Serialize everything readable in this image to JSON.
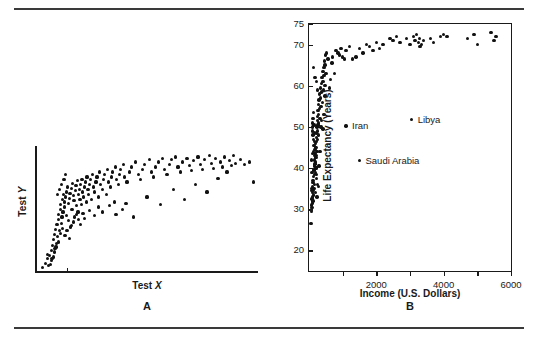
{
  "figure": {
    "rule_top": "horizontal-rule",
    "rule_bottom": "horizontal-rule"
  },
  "panel_a": {
    "letter": "A",
    "xlabel_text": "Test ",
    "xlabel_italic": "X",
    "ylabel_text": "Test ",
    "ylabel_italic": "Y"
  },
  "panel_b": {
    "letter": "B",
    "xlabel": "Income (U.S. Dollars)",
    "ylabel": "Life Expectancy (Years)",
    "ytick_labels": [
      "75",
      "70",
      "60",
      "50",
      "40",
      "30",
      "20"
    ],
    "xtick_labels": [
      "2000",
      "4000",
      "6000"
    ],
    "annotations": [
      {
        "label": "Iran",
        "x": 1100,
        "y": 50.2
      },
      {
        "label": "Libya",
        "x": 3050,
        "y": 51.8
      },
      {
        "label": "Saudi Arabia",
        "x": 1500,
        "y": 41.8
      }
    ]
  },
  "chart_data": [
    {
      "type": "scatter",
      "title": "A",
      "xlabel": "Test X",
      "ylabel": "Test Y",
      "xlim": [
        0,
        100
      ],
      "ylim": [
        0,
        100
      ],
      "grid": false,
      "axis_style": "open-left-bottom",
      "xticks": [
        14
      ],
      "yticks": [],
      "points": [
        [
          3.0,
          3.5
        ],
        [
          4.2,
          7.0
        ],
        [
          5.0,
          10.5
        ],
        [
          5.8,
          5.0
        ],
        [
          6.2,
          13.0
        ],
        [
          6.8,
          9.0
        ],
        [
          7.0,
          17.5
        ],
        [
          7.5,
          21.0
        ],
        [
          7.8,
          12.0
        ],
        [
          8.0,
          26.0
        ],
        [
          8.4,
          30.0
        ],
        [
          8.6,
          18.5
        ],
        [
          8.9,
          34.0
        ],
        [
          9.2,
          23.0
        ],
        [
          9.5,
          38.0
        ],
        [
          9.8,
          28.5
        ],
        [
          10.0,
          42.0
        ],
        [
          10.3,
          46.0
        ],
        [
          10.6,
          33.0
        ],
        [
          10.9,
          50.0
        ],
        [
          11.2,
          54.0
        ],
        [
          11.4,
          39.0
        ],
        [
          11.7,
          44.0
        ],
        [
          12.0,
          58.0
        ],
        [
          12.2,
          48.0
        ],
        [
          12.5,
          62.0
        ],
        [
          12.8,
          52.0
        ],
        [
          13.0,
          56.0
        ],
        [
          13.3,
          60.0
        ],
        [
          13.6,
          64.0
        ],
        [
          13.9,
          45.0
        ],
        [
          14.2,
          68.0
        ],
        [
          14.5,
          41.0
        ],
        [
          14.8,
          55.0
        ],
        [
          15.0,
          59.0
        ],
        [
          15.3,
          63.0
        ],
        [
          15.6,
          36.0
        ],
        [
          15.9,
          67.0
        ],
        [
          16.2,
          50.0
        ],
        [
          16.5,
          71.0
        ],
        [
          16.8,
          61.0
        ],
        [
          17.1,
          57.0
        ],
        [
          17.4,
          44.0
        ],
        [
          17.7,
          65.0
        ],
        [
          18.0,
          69.0
        ],
        [
          18.3,
          53.0
        ],
        [
          18.6,
          73.0
        ],
        [
          18.9,
          48.0
        ],
        [
          19.2,
          62.0
        ],
        [
          19.5,
          66.0
        ],
        [
          19.8,
          58.0
        ],
        [
          20.1,
          70.0
        ],
        [
          20.4,
          54.0
        ],
        [
          20.7,
          74.0
        ],
        [
          21.0,
          64.0
        ],
        [
          21.4,
          60.0
        ],
        [
          21.8,
          68.0
        ],
        [
          22.2,
          72.0
        ],
        [
          22.6,
          56.0
        ],
        [
          23.0,
          76.0
        ],
        [
          23.4,
          66.0
        ],
        [
          23.8,
          62.0
        ],
        [
          24.2,
          70.0
        ],
        [
          24.6,
          74.0
        ],
        [
          25.0,
          58.0
        ],
        [
          25.5,
          78.0
        ],
        [
          26.0,
          68.0
        ],
        [
          26.5,
          64.0
        ],
        [
          27.0,
          72.0
        ],
        [
          27.5,
          76.0
        ],
        [
          28.0,
          60.0
        ],
        [
          28.6,
          80.0
        ],
        [
          29.2,
          70.0
        ],
        [
          29.8,
          66.0
        ],
        [
          30.4,
          74.0
        ],
        [
          31.0,
          78.0
        ],
        [
          31.6,
          62.0
        ],
        [
          32.2,
          82.0
        ],
        [
          32.8,
          72.0
        ],
        [
          33.4,
          68.0
        ],
        [
          34.0,
          76.0
        ],
        [
          34.6,
          80.0
        ],
        [
          35.2,
          56.0
        ],
        [
          35.8,
          84.0
        ],
        [
          36.4,
          74.0
        ],
        [
          37.0,
          70.0
        ],
        [
          37.6,
          78.0
        ],
        [
          38.2,
          82.0
        ],
        [
          38.8,
          50.0
        ],
        [
          39.4,
          86.0
        ],
        [
          40.0,
          76.0
        ],
        [
          41.0,
          72.0
        ],
        [
          42.0,
          80.0
        ],
        [
          43.0,
          84.0
        ],
        [
          44.0,
          44.0
        ],
        [
          45.0,
          88.0
        ],
        [
          46.0,
          78.0
        ],
        [
          47.0,
          74.0
        ],
        [
          48.0,
          82.0
        ],
        [
          49.0,
          86.0
        ],
        [
          50.0,
          60.0
        ],
        [
          51.0,
          90.0
        ],
        [
          52.0,
          80.0
        ],
        [
          53.0,
          76.0
        ],
        [
          54.0,
          84.0
        ],
        [
          55.0,
          88.0
        ],
        [
          56.0,
          54.0
        ],
        [
          57.0,
          91.0
        ],
        [
          58.0,
          82.0
        ],
        [
          59.0,
          78.0
        ],
        [
          60.0,
          86.0
        ],
        [
          61.0,
          90.0
        ],
        [
          62.0,
          66.0
        ],
        [
          63.0,
          92.0
        ],
        [
          64.0,
          84.0
        ],
        [
          65.0,
          80.0
        ],
        [
          66.0,
          88.0
        ],
        [
          67.0,
          58.0
        ],
        [
          68.0,
          91.0
        ],
        [
          69.0,
          85.0
        ],
        [
          70.0,
          81.0
        ],
        [
          71.0,
          89.0
        ],
        [
          72.0,
          70.0
        ],
        [
          73.0,
          92.0
        ],
        [
          74.0,
          86.0
        ],
        [
          75.0,
          82.0
        ],
        [
          76.0,
          90.0
        ],
        [
          77.0,
          64.0
        ],
        [
          78.0,
          93.0
        ],
        [
          79.0,
          87.0
        ],
        [
          80.0,
          83.0
        ],
        [
          81.0,
          91.0
        ],
        [
          82.0,
          75.0
        ],
        [
          83.0,
          88.0
        ],
        [
          84.0,
          84.0
        ],
        [
          85.0,
          92.0
        ],
        [
          86.0,
          80.0
        ],
        [
          87.0,
          89.0
        ],
        [
          88.0,
          85.0
        ],
        [
          89.0,
          93.0
        ],
        [
          90.0,
          87.0
        ],
        [
          92.0,
          90.0
        ],
        [
          94.0,
          86.0
        ],
        [
          96.0,
          88.0
        ],
        [
          98.0,
          72.0
        ],
        [
          11.0,
          31.0
        ],
        [
          12.1,
          35.0
        ],
        [
          13.1,
          29.0
        ],
        [
          14.0,
          33.0
        ],
        [
          15.1,
          27.0
        ],
        [
          16.0,
          37.0
        ],
        [
          9.0,
          20.0
        ],
        [
          10.2,
          24.0
        ],
        [
          8.2,
          16.0
        ],
        [
          7.2,
          11.0
        ],
        [
          6.5,
          6.0
        ],
        [
          5.2,
          14.0
        ],
        [
          17.0,
          40.0
        ],
        [
          18.1,
          46.0
        ],
        [
          19.0,
          42.0
        ],
        [
          20.0,
          38.0
        ],
        [
          21.2,
          47.0
        ],
        [
          22.0,
          43.0
        ],
        [
          24.0,
          49.0
        ],
        [
          26.2,
          45.0
        ],
        [
          28.2,
          52.0
        ],
        [
          30.0,
          48.0
        ],
        [
          33.0,
          53.0
        ],
        [
          36.0,
          46.0
        ],
        [
          40.5,
          55.0
        ],
        [
          11.5,
          70.0
        ],
        [
          12.6,
          74.0
        ],
        [
          13.4,
          78.0
        ],
        [
          10.5,
          66.0
        ],
        [
          9.6,
          62.0
        ]
      ]
    },
    {
      "type": "scatter",
      "title": "B",
      "xlabel": "Income (U.S. Dollars)",
      "ylabel": "Life Expectancy (Years)",
      "xlim": [
        0,
        6000
      ],
      "ylim": [
        15,
        75
      ],
      "grid": false,
      "axis_style": "box-frame",
      "xticks": [
        1000,
        2000,
        3000,
        4000,
        5000,
        6000
      ],
      "xticklabels": {
        "2000": "2000",
        "4000": "4000",
        "6000": "6000"
      },
      "yticks": [
        20,
        30,
        40,
        50,
        60,
        70,
        75
      ],
      "points": [
        [
          60,
          26.5
        ],
        [
          70,
          30.0
        ],
        [
          75,
          31.0
        ],
        [
          80,
          29.5
        ],
        [
          85,
          32.5
        ],
        [
          90,
          30.5
        ],
        [
          95,
          34.0
        ],
        [
          100,
          31.5
        ],
        [
          105,
          33.0
        ],
        [
          110,
          35.5
        ],
        [
          115,
          32.0
        ],
        [
          120,
          36.5
        ],
        [
          125,
          34.5
        ],
        [
          130,
          38.0
        ],
        [
          135,
          33.5
        ],
        [
          140,
          37.0
        ],
        [
          145,
          39.5
        ],
        [
          150,
          35.0
        ],
        [
          155,
          40.5
        ],
        [
          160,
          38.5
        ],
        [
          165,
          42.0
        ],
        [
          170,
          36.0
        ],
        [
          175,
          41.0
        ],
        [
          180,
          43.5
        ],
        [
          185,
          39.0
        ],
        [
          190,
          44.5
        ],
        [
          195,
          42.5
        ],
        [
          200,
          46.0
        ],
        [
          205,
          40.0
        ],
        [
          210,
          45.0
        ],
        [
          215,
          47.5
        ],
        [
          220,
          43.0
        ],
        [
          225,
          48.5
        ],
        [
          230,
          46.5
        ],
        [
          235,
          50.0
        ],
        [
          240,
          44.0
        ],
        [
          245,
          49.0
        ],
        [
          250,
          51.5
        ],
        [
          255,
          47.0
        ],
        [
          260,
          52.5
        ],
        [
          265,
          50.5
        ],
        [
          270,
          54.0
        ],
        [
          275,
          48.0
        ],
        [
          280,
          53.0
        ],
        [
          285,
          55.5
        ],
        [
          290,
          51.0
        ],
        [
          300,
          56.5
        ],
        [
          310,
          54.5
        ],
        [
          320,
          58.0
        ],
        [
          330,
          52.0
        ],
        [
          340,
          57.0
        ],
        [
          350,
          59.5
        ],
        [
          360,
          55.0
        ],
        [
          370,
          60.5
        ],
        [
          380,
          58.5
        ],
        [
          390,
          62.0
        ],
        [
          400,
          56.0
        ],
        [
          410,
          61.0
        ],
        [
          420,
          63.5
        ],
        [
          430,
          59.0
        ],
        [
          440,
          64.5
        ],
        [
          450,
          62.5
        ],
        [
          460,
          66.0
        ],
        [
          470,
          60.0
        ],
        [
          480,
          65.0
        ],
        [
          490,
          67.5
        ],
        [
          500,
          63.0
        ],
        [
          130,
          64.5
        ],
        [
          180,
          62.0
        ],
        [
          220,
          61.0
        ],
        [
          250,
          59.0
        ],
        [
          100,
          50.0
        ],
        [
          110,
          49.0
        ],
        [
          120,
          48.0
        ],
        [
          140,
          47.0
        ],
        [
          150,
          45.5
        ],
        [
          160,
          44.5
        ],
        [
          170,
          43.0
        ],
        [
          190,
          41.5
        ],
        [
          210,
          40.0
        ],
        [
          230,
          38.5
        ],
        [
          105,
          51.0
        ],
        [
          115,
          52.0
        ],
        [
          135,
          53.5
        ],
        [
          145,
          50.5
        ],
        [
          165,
          46.5
        ],
        [
          185,
          45.0
        ],
        [
          205,
          42.5
        ],
        [
          225,
          37.5
        ],
        [
          245,
          36.0
        ],
        [
          90,
          39.0
        ],
        [
          95,
          37.0
        ],
        [
          85,
          35.0
        ],
        [
          80,
          34.5
        ],
        [
          75,
          42.0
        ],
        [
          100,
          43.5
        ],
        [
          130,
          44.0
        ],
        [
          160,
          48.5
        ],
        [
          200,
          34.0
        ],
        [
          240,
          33.0
        ],
        [
          280,
          35.5
        ],
        [
          300,
          40.5
        ],
        [
          330,
          44.0
        ],
        [
          360,
          50.0
        ],
        [
          380,
          51.5
        ],
        [
          420,
          49.5
        ],
        [
          450,
          53.0
        ],
        [
          480,
          57.5
        ],
        [
          520,
          68.0
        ],
        [
          560,
          66.5
        ],
        [
          600,
          59.5
        ],
        [
          640,
          61.5
        ],
        [
          680,
          65.5
        ],
        [
          700,
          67.0
        ],
        [
          760,
          63.0
        ],
        [
          800,
          68.5
        ],
        [
          860,
          68.0
        ],
        [
          900,
          67.5
        ],
        [
          950,
          69.0
        ],
        [
          1000,
          67.0
        ],
        [
          1050,
          66.5
        ],
        [
          1100,
          68.5
        ],
        [
          1200,
          69.5
        ],
        [
          1300,
          66.5
        ],
        [
          1400,
          67.0
        ],
        [
          1500,
          69.0
        ],
        [
          1600,
          68.0
        ],
        [
          1700,
          70.0
        ],
        [
          1800,
          69.5
        ],
        [
          1900,
          68.5
        ],
        [
          2000,
          70.5
        ],
        [
          2100,
          69.0
        ],
        [
          2200,
          70.0
        ],
        [
          2400,
          71.5
        ],
        [
          2500,
          71.0
        ],
        [
          2600,
          72.0
        ],
        [
          2700,
          70.5
        ],
        [
          2900,
          71.5
        ],
        [
          3000,
          70.0
        ],
        [
          3100,
          72.0
        ],
        [
          3150,
          71.0
        ],
        [
          3200,
          72.5
        ],
        [
          3250,
          70.5
        ],
        [
          3280,
          71.5
        ],
        [
          3300,
          69.5
        ],
        [
          3350,
          70.0
        ],
        [
          3400,
          71.0
        ],
        [
          3600,
          71.5
        ],
        [
          3700,
          70.5
        ],
        [
          3900,
          72.0
        ],
        [
          4000,
          72.5
        ],
        [
          4100,
          72.0
        ],
        [
          4700,
          71.5
        ],
        [
          4900,
          72.5
        ],
        [
          5000,
          70.0
        ],
        [
          5400,
          73.0
        ],
        [
          5500,
          71.0
        ],
        [
          5550,
          72.0
        ]
      ],
      "annotations": [
        {
          "label": "Iran",
          "x": 1100,
          "y": 50.2
        },
        {
          "label": "Libya",
          "x": 3050,
          "y": 51.8
        },
        {
          "label": "Saudi Arabia",
          "x": 1500,
          "y": 41.8
        }
      ]
    }
  ]
}
